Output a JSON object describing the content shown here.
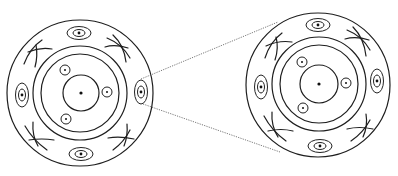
{
  "diagram": {
    "colors": {
      "stroke": "#1e1e1e",
      "leader": "#555555",
      "background": "#ffffff"
    },
    "views": [
      {
        "id": "left",
        "center": [
          80,
          93
        ],
        "outer_radius": 73,
        "rings": [
          47,
          39
        ],
        "inner_radius": 18,
        "small_circles": [
          [
            65,
            70
          ],
          [
            107,
            92
          ],
          [
            66,
            119
          ]
        ],
        "peripheral_ellipses": [
          {
            "pos": [
              79,
              33
            ],
            "orientation": "horizontal"
          },
          {
            "pos": [
              22,
              95
            ],
            "orientation": "vertical"
          },
          {
            "pos": [
              141,
              92
            ],
            "orientation": "vertical"
          },
          {
            "pos": [
              81,
              154
            ],
            "orientation": "horizontal"
          }
        ]
      },
      {
        "id": "right",
        "center": [
          318,
          84
        ],
        "outer_radius": 72,
        "rings": [
          47,
          39
        ],
        "inner_radius": 19,
        "small_circles": [
          [
            302,
            62
          ],
          [
            346,
            83
          ],
          [
            303,
            108
          ]
        ],
        "peripheral_ellipses": [
          {
            "pos": [
              318,
              25
            ],
            "orientation": "horizontal"
          },
          {
            "pos": [
              261,
              87
            ],
            "orientation": "vertical"
          },
          {
            "pos": [
              377,
              81
            ],
            "orientation": "vertical"
          },
          {
            "pos": [
              320,
              146
            ],
            "orientation": "horizontal"
          }
        ]
      }
    ],
    "leader_lines": [
      {
        "from": [
          141,
          79
        ],
        "to": [
          278,
          22
        ]
      },
      {
        "from": [
          143,
          104
        ],
        "to": [
          280,
          152
        ]
      }
    ]
  }
}
